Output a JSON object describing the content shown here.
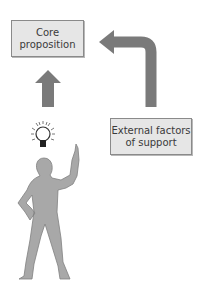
{
  "diagram": {
    "boxes": {
      "core": {
        "line1": "Core",
        "line2": "proposition"
      },
      "external": {
        "line1": "External factors",
        "line2": "of support"
      }
    },
    "arrows": [
      {
        "from": "person-idea",
        "to": "core",
        "direction": "up"
      },
      {
        "from": "external",
        "to": "core",
        "direction": "up-then-left"
      }
    ],
    "icons": [
      "light-bulb-icon",
      "person-figure"
    ],
    "colors": {
      "box_fill": "#e6e6e6",
      "box_border": "#8a8a8a",
      "arrow": "#7a7a7a",
      "figure": "#a8a8a8",
      "text": "#3a3a3a"
    }
  }
}
